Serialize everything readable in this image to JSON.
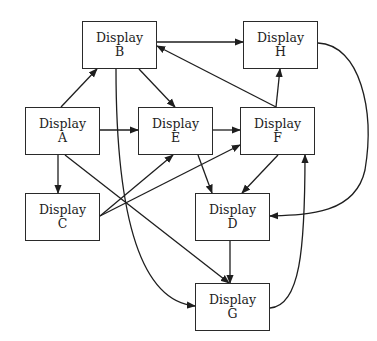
{
  "diagram": {
    "type": "directed-graph",
    "nodes": [
      {
        "id": "A",
        "line1": "Display",
        "line2": "A",
        "x": 25,
        "y": 107,
        "w": 75,
        "h": 48
      },
      {
        "id": "B",
        "line1": "Display",
        "line2": "B",
        "x": 82,
        "y": 21,
        "w": 75,
        "h": 48
      },
      {
        "id": "C",
        "line1": "Display",
        "line2": "C",
        "x": 25,
        "y": 193,
        "w": 75,
        "h": 48
      },
      {
        "id": "D",
        "line1": "Display",
        "line2": "D",
        "x": 195,
        "y": 193,
        "w": 75,
        "h": 48
      },
      {
        "id": "E",
        "line1": "Display",
        "line2": "E",
        "x": 138,
        "y": 107,
        "w": 75,
        "h": 48
      },
      {
        "id": "F",
        "line1": "Display",
        "line2": "F",
        "x": 240,
        "y": 107,
        "w": 75,
        "h": 48
      },
      {
        "id": "G",
        "line1": "Display",
        "line2": "G",
        "x": 195,
        "y": 283,
        "w": 75,
        "h": 48
      },
      {
        "id": "H",
        "line1": "Display",
        "line2": "H",
        "x": 243,
        "y": 21,
        "w": 75,
        "h": 48
      }
    ],
    "edges": [
      {
        "from": "A",
        "to": "B",
        "path": "M61,107 L97,69"
      },
      {
        "from": "A",
        "to": "E",
        "path": "M100,130 L138,130"
      },
      {
        "from": "A",
        "to": "C",
        "path": "M58,155 L58,193"
      },
      {
        "from": "A",
        "to": "G",
        "path": "M65,155 L229,283"
      },
      {
        "from": "B",
        "to": "H",
        "path": "M157,42 L243,42"
      },
      {
        "from": "B",
        "to": "E",
        "path": "M139,69 L175,107"
      },
      {
        "from": "B",
        "to": "G",
        "path": "M116,69 C116,180 130,300 195,306"
      },
      {
        "from": "C",
        "to": "E",
        "path": "M100,216 L173,155"
      },
      {
        "from": "C",
        "to": "F",
        "path": "M100,216 L240,145"
      },
      {
        "from": "E",
        "to": "F",
        "path": "M213,130 L240,130"
      },
      {
        "from": "E",
        "to": "D",
        "path": "M198,155 L212,193"
      },
      {
        "from": "F",
        "to": "B",
        "path": "M276,107 L157,46"
      },
      {
        "from": "F",
        "to": "H",
        "path": "M276,107 L280,69"
      },
      {
        "from": "F",
        "to": "D",
        "path": "M278,155 L242,193"
      },
      {
        "from": "H",
        "to": "D",
        "path": "M318,43 C360,45 375,110 365,170 C355,215 305,215 270,216"
      },
      {
        "from": "D",
        "to": "G",
        "path": "M230,241 L230,283"
      },
      {
        "from": "G",
        "to": "F",
        "path": "M270,308 C300,306 305,250 305,155"
      }
    ]
  },
  "colors": {
    "stroke": "#1e1e1e",
    "text": "#222222",
    "background": "#ffffff"
  }
}
